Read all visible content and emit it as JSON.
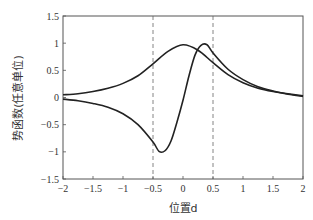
{
  "chart_data": {
    "type": "line",
    "title": "",
    "xlabel": "位置d",
    "ylabel": "势函数(任意单位)",
    "xlim": [
      -2,
      2
    ],
    "ylim": [
      -1.5,
      1.5
    ],
    "xticks": [
      -2,
      -1.5,
      -1,
      -0.5,
      0,
      0.5,
      1,
      1.5,
      2
    ],
    "xtick_labels": [
      "−2",
      "−1.5",
      "−1",
      "−0.5",
      "0",
      "0.5",
      "1",
      "1.5",
      "2"
    ],
    "yticks": [
      1.5,
      1,
      0.5,
      0,
      -0.5,
      -1,
      -1.5
    ],
    "ytick_labels": [
      "1.5",
      "1",
      "0.5",
      "0",
      "−0.5",
      "−1",
      "−1.5"
    ],
    "grid": false,
    "legend": null,
    "vlines": [
      {
        "x": -0.5,
        "style": "dashed"
      },
      {
        "x": 0.5,
        "style": "dashed"
      }
    ],
    "series": [
      {
        "name": "symmetric-potential",
        "x": [
          -2,
          -1.75,
          -1.5,
          -1.25,
          -1,
          -0.75,
          -0.5,
          -0.25,
          0,
          0.25,
          0.5,
          0.75,
          1,
          1.25,
          1.5,
          1.75,
          2
        ],
        "values": [
          0.05,
          0.07,
          0.11,
          0.17,
          0.26,
          0.4,
          0.62,
          0.85,
          0.97,
          0.87,
          0.64,
          0.42,
          0.27,
          0.17,
          0.11,
          0.07,
          0.03
        ]
      },
      {
        "name": "antisymmetric-potential",
        "x": [
          -2,
          -1.75,
          -1.5,
          -1.25,
          -1,
          -0.75,
          -0.5,
          -0.4,
          -0.3,
          -0.2,
          -0.1,
          0,
          0.1,
          0.2,
          0.3,
          0.4,
          0.5,
          0.75,
          1,
          1.25,
          1.5,
          1.75,
          2
        ],
        "values": [
          -0.03,
          -0.06,
          -0.11,
          -0.18,
          -0.3,
          -0.5,
          -0.82,
          -0.99,
          -0.98,
          -0.8,
          -0.45,
          -0.05,
          0.4,
          0.78,
          0.96,
          0.97,
          0.82,
          0.52,
          0.33,
          0.2,
          0.12,
          0.06,
          0.02
        ]
      }
    ],
    "colors": {
      "line": "#222222",
      "axis": "#555555",
      "vline": "#666666"
    }
  }
}
